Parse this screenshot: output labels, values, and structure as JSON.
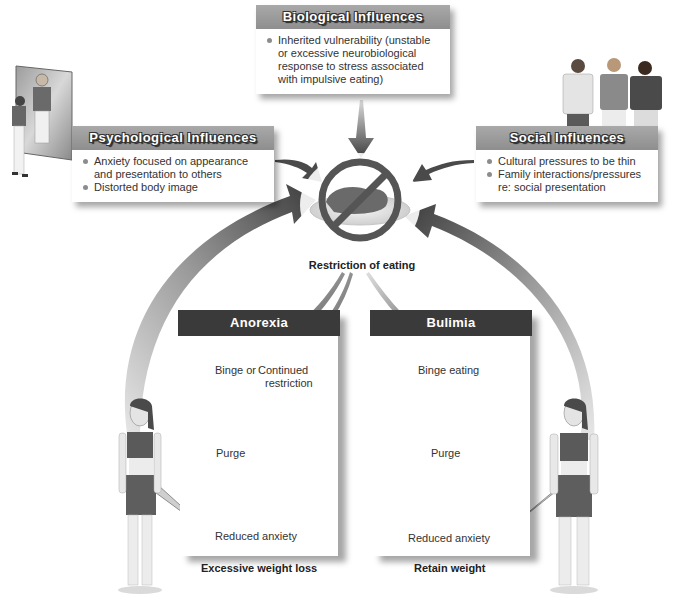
{
  "influences": {
    "biological": {
      "title": "Biological Influences",
      "items": [
        "Inherited vulnerability (unstable or excessive neurobiological response to stress associated with impulsive eating)"
      ]
    },
    "psychological": {
      "title": "Psychological Influences",
      "items": [
        "Anxiety focused on appearance and presentation to others",
        "Distorted body image"
      ]
    },
    "social": {
      "title": "Social Influences",
      "items": [
        "Cultural pressures to be thin",
        "Family interactions/pressures re: social presentation"
      ]
    }
  },
  "center": {
    "label": "Restriction of eating",
    "icon": "no-food-prohibition-icon"
  },
  "anorexia": {
    "title": "Anorexia",
    "nodes": {
      "binge": "Binge or",
      "continued_1": "Continued",
      "continued_2": "restriction",
      "purge": "Purge",
      "reduced": "Reduced anxiety"
    },
    "outcome": "Excessive weight loss"
  },
  "bulimia": {
    "title": "Bulimia",
    "nodes": {
      "binge": "Binge eating",
      "purge": "Purge",
      "reduced": "Reduced anxiety"
    },
    "outcome": "Retain weight"
  },
  "illustrations": {
    "mirror": "person-looking-in-mirror",
    "group": "three-people-group",
    "left_figure": "thin-woman-figure",
    "right_figure": "woman-figure"
  },
  "colors": {
    "header_gray": "#9a9a9a",
    "panel_dark": "#3a3a3a",
    "arrow_dark": "#4a4a4a",
    "background": "#ffffff"
  }
}
